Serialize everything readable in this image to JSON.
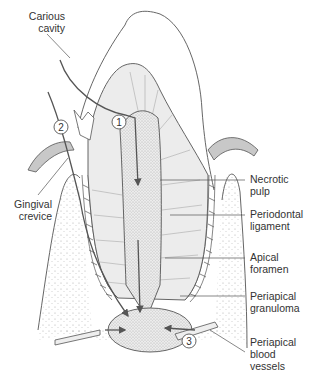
{
  "diagram": {
    "colors": {
      "outline": "#555555",
      "dentin_fill": "#ececec",
      "pulp_fill": "#e2e2e2",
      "gum_fill": "#c8c8c8",
      "stipple": "#9a9a9a",
      "text": "#333333"
    },
    "labels_left": [
      {
        "id": "carious-cavity",
        "text": "Carious\ncavity"
      },
      {
        "id": "gingival-crevice",
        "text": "Gingival\ncrevice"
      }
    ],
    "labels_right": [
      {
        "id": "necrotic-pulp",
        "text": "Necrotic\npulp"
      },
      {
        "id": "periodontal-ligament",
        "text": "Periodontal\nligament"
      },
      {
        "id": "apical-foramen",
        "text": "Apical\nforamen"
      },
      {
        "id": "periapical-granuloma",
        "text": "Periapical\ngranuloma"
      },
      {
        "id": "periapical-blood-vessels",
        "text": "Periapical\nblood\nvessels"
      }
    ],
    "markers": [
      {
        "id": "pathway-1",
        "text": "1"
      },
      {
        "id": "pathway-2",
        "text": "2"
      },
      {
        "id": "pathway-3",
        "text": "3"
      }
    ]
  }
}
